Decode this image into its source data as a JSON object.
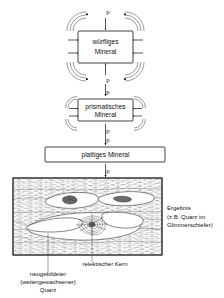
{
  "figure": {
    "title": "",
    "boxes": [
      {
        "id": "box-cubic",
        "label_line1": "würfliges",
        "label_line2": "Mineral"
      },
      {
        "id": "box-prismatic",
        "label_line1": "prismatisches",
        "label_line2": "Mineral"
      },
      {
        "id": "box-platy",
        "label_line1": "plattiges Mineral",
        "label_line2": ""
      }
    ],
    "pressure_symbol": "p",
    "pressure_labels": [
      {
        "name": "p-top-cubic",
        "text": "p"
      },
      {
        "name": "p-bottom-cubic",
        "text": "p"
      },
      {
        "name": "p-top-prismatic",
        "text": "p"
      },
      {
        "name": "p-bottom-prismatic",
        "text": "p"
      },
      {
        "name": "p-top-platy",
        "text": "p"
      },
      {
        "name": "p-bottom-platy",
        "text": "p"
      }
    ],
    "panel": {
      "name": "schist-panel",
      "result_label_lines": [
        "Ergebnis",
        "(z.B. Quarz im",
        "Glimmerschiefer)"
      ],
      "annotation_relic": "relektischer Kern",
      "annotation_new_quartz_lines": [
        "neugebildeter",
        "(weitergewachsener)",
        "Quarz"
      ]
    },
    "colors": {
      "ink": "#111111",
      "loop_gray": "#6f6f6f",
      "texture_gray": "#5d5d5d",
      "grain_fill": "#ffffff",
      "dark_grain": "#6a6a6a",
      "background": "#ffffff"
    }
  }
}
